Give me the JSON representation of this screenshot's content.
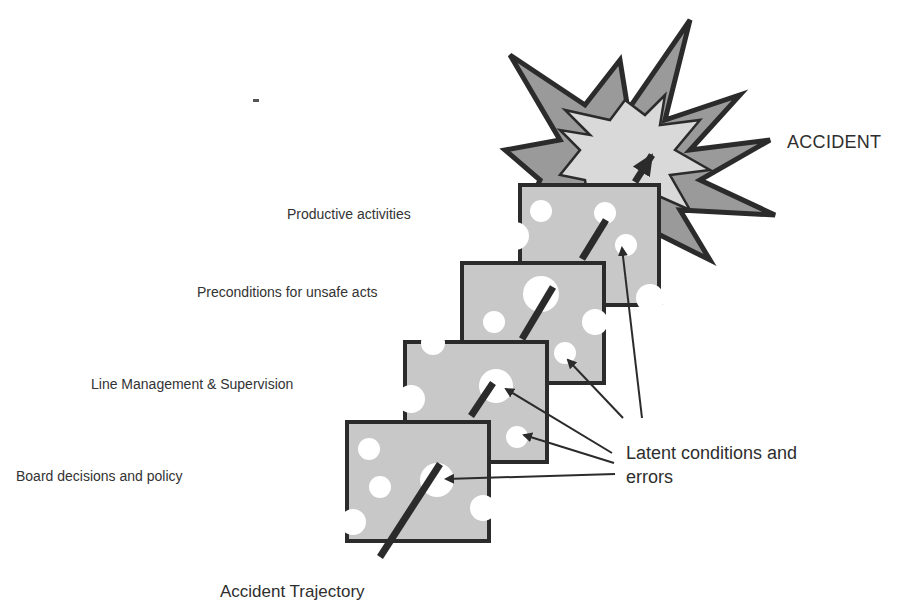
{
  "diagram": {
    "accident_label": "ACCIDENT",
    "trajectory_label": "Accident Trajectory",
    "latent_label_line1": "Latent conditions and",
    "latent_label_line2": "errors",
    "layers": [
      {
        "id": "board",
        "label": "Board decisions and policy"
      },
      {
        "id": "line-management",
        "label": "Line Management & Supervision"
      },
      {
        "id": "preconditions",
        "label": "Preconditions for unsafe acts"
      },
      {
        "id": "productive",
        "label": "Productive activities"
      }
    ],
    "colors": {
      "plate_fill": "#c8c8c8",
      "plate_border": "#2b2b2b",
      "hole": "#ffffff",
      "star_outer": "#9a9a9a",
      "star_inner": "#d9d9d9",
      "arrow": "#2b2b2b",
      "text": "#333333"
    }
  }
}
